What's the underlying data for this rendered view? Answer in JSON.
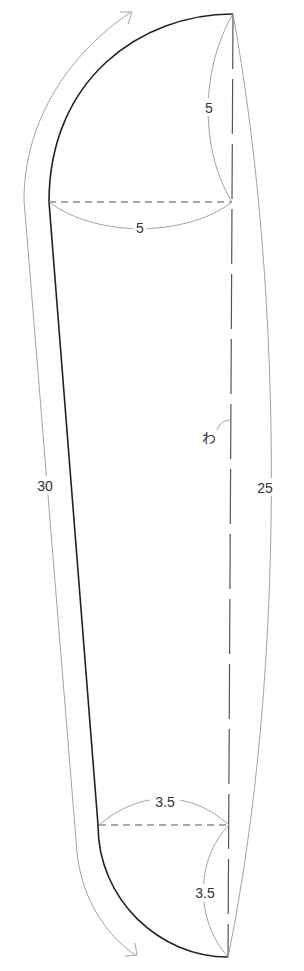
{
  "diagram": {
    "type": "sewing-pattern",
    "labels": {
      "top_vertical": "5",
      "top_horizontal": "5",
      "fold": "わ",
      "left_length": "30",
      "right_length": "25",
      "bottom_horizontal": "3.5",
      "bottom_vertical": "3.5"
    },
    "colors": {
      "outline": "#222222",
      "guide": "#999999",
      "dashed": "#555555",
      "text": "#333333"
    }
  }
}
